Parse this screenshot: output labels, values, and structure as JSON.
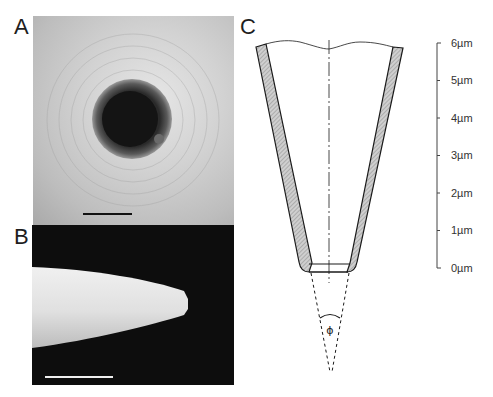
{
  "figure": {
    "panels": [
      {
        "id": "A",
        "label": "A",
        "description": "SEM top view of tip aperture",
        "has_scale_bar": true
      },
      {
        "id": "B",
        "label": "B",
        "description": "SEM side view of tapered tip",
        "has_scale_bar": true
      },
      {
        "id": "C",
        "label": "C",
        "description": "Schematic cross-section of coated conical tip with cone angle"
      }
    ],
    "schematic": {
      "angle_symbol": "ϕ",
      "scale": {
        "ticks": [
          "6µm",
          "5µm",
          "4µm",
          "3µm",
          "2µm",
          "1µm",
          "0µm"
        ]
      }
    },
    "colors": {
      "line": "#1a1a1a",
      "coating_fill": "#b8b8b8",
      "photo_b_background": "#0d0d0d"
    }
  }
}
